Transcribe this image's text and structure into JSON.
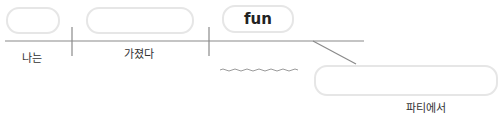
{
  "diagram": {
    "type": "sentence-diagram",
    "boxes": [
      {
        "id": "subject-box",
        "text": ""
      },
      {
        "id": "verb-box",
        "text": ""
      },
      {
        "id": "object-box",
        "text": "fun"
      },
      {
        "id": "modifier-box",
        "text": ""
      }
    ],
    "labels": {
      "subject": "나는",
      "verb": "가졌다",
      "modifier": "파티에서"
    },
    "colors": {
      "line": "#8a8a8a",
      "box_border": "#e6e6e6",
      "text": "#333333"
    }
  }
}
